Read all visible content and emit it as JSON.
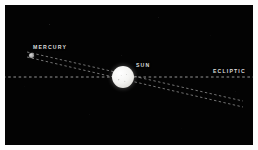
{
  "figure": {
    "kind": "astronomy-diagram",
    "background_color": "#030303",
    "frame_color": "#fdfdfd",
    "line_color": "#d0d0d0",
    "label_color": "#dcdcdc"
  },
  "labels": {
    "mercury": "MERCURY",
    "sun": "SUN",
    "ecliptic": "ECLIPTIC"
  },
  "bodies": {
    "sun": {
      "name": "Sun",
      "color": "#f5f5f2"
    },
    "mercury": {
      "name": "Mercury",
      "color": "#a2a2a2"
    }
  },
  "lines": {
    "ecliptic": {
      "name": "ecliptic-plane",
      "style": "dashed",
      "orientation": "horizontal"
    },
    "orbit_upper": {
      "name": "mercury-orbit-upper",
      "style": "dashed"
    },
    "orbit_lower": {
      "name": "mercury-orbit-lower",
      "style": "dashed"
    }
  }
}
